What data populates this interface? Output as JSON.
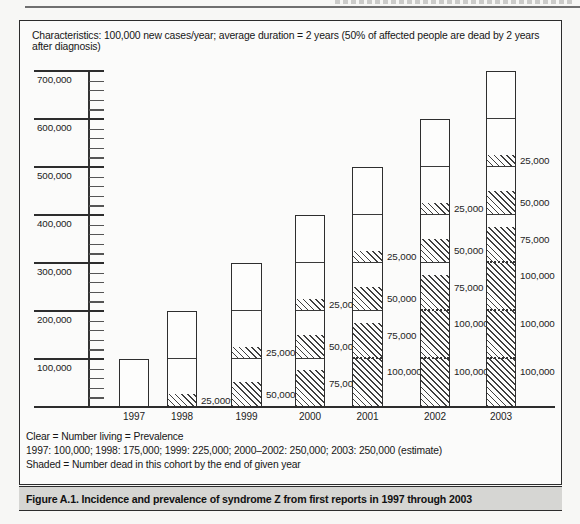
{
  "figure": {
    "characteristics": "Characteristics: 100,000 new cases/year; average duration = 2 years (50% of affected people are dead by 2 years after diagnosis)",
    "legend": {
      "line1": "Clear = Number living = Prevalence",
      "line2": "1997: 100,000; 1998: 175,000; 1999: 225,000; 2000–2002: 250,000; 2003: 250,000 (estimate)",
      "line3": "Shaded = Number dead in this cohort by the end of given year"
    },
    "caption": "Figure A.1. Incidence and prevalence of syndrome Z from first reports in 1997 through 2003"
  },
  "chart_data": {
    "type": "bar",
    "stacked": true,
    "title": "Figure A.1. Incidence and prevalence of syndrome Z from first reports in 1997 through 2003",
    "xlabel": "",
    "ylabel": "",
    "categories": [
      "1997",
      "1998",
      "1999",
      "2000",
      "2001",
      "2002",
      "2003"
    ],
    "y_axis": {
      "min": 0,
      "max": 700000,
      "major_tick_interval": 100000,
      "minor_tick_interval": 20000,
      "major_tick_labels": [
        "100,000",
        "200,000",
        "300,000",
        "400,000",
        "500,000",
        "600,000",
        "700,000"
      ]
    },
    "totals": [
      100000,
      200000,
      300000,
      400000,
      500000,
      600000,
      700000
    ],
    "prevalence_living": [
      100000,
      175000,
      225000,
      250000,
      250000,
      250000,
      250000
    ],
    "fill_legend": {
      "clear": "number living (prevalence)",
      "shaded": "number dead in cohort by end of given year"
    },
    "bars": [
      {
        "year": "1997",
        "segments": [
          {
            "v": 100,
            "fill": "clear"
          }
        ],
        "dividers": []
      },
      {
        "year": "1998",
        "segments": [
          {
            "v": 25,
            "fill": "shaded",
            "label": "25,000*"
          },
          {
            "v": 75,
            "fill": "clear"
          },
          {
            "v": 100,
            "fill": "clear"
          }
        ],
        "dividers": [
          {
            "at": 100,
            "style": "solid"
          }
        ]
      },
      {
        "year": "1999",
        "segments": [
          {
            "v": 50,
            "fill": "shaded",
            "label": "50,000"
          },
          {
            "v": 50,
            "fill": "clear"
          },
          {
            "v": 25,
            "fill": "shaded",
            "label": "25,000"
          },
          {
            "v": 75,
            "fill": "clear"
          },
          {
            "v": 100,
            "fill": "clear"
          }
        ],
        "dividers": [
          {
            "at": 100,
            "style": "solid"
          },
          {
            "at": 200,
            "style": "solid"
          }
        ]
      },
      {
        "year": "2000",
        "segments": [
          {
            "v": 75,
            "fill": "shaded",
            "label": "75,000"
          },
          {
            "v": 25,
            "fill": "clear"
          },
          {
            "v": 50,
            "fill": "shaded",
            "label": "50,000"
          },
          {
            "v": 50,
            "fill": "clear"
          },
          {
            "v": 25,
            "fill": "shaded",
            "label": "25,000"
          },
          {
            "v": 75,
            "fill": "clear"
          },
          {
            "v": 100,
            "fill": "clear"
          }
        ],
        "dividers": [
          {
            "at": 100,
            "style": "solid"
          },
          {
            "at": 200,
            "style": "solid"
          },
          {
            "at": 300,
            "style": "solid"
          }
        ]
      },
      {
        "year": "2001",
        "segments": [
          {
            "v": 100,
            "fill": "shaded",
            "label": "100,000"
          },
          {
            "v": 75,
            "fill": "shaded",
            "label": "75,000"
          },
          {
            "v": 25,
            "fill": "clear"
          },
          {
            "v": 50,
            "fill": "shaded",
            "label": "50,000"
          },
          {
            "v": 50,
            "fill": "clear"
          },
          {
            "v": 25,
            "fill": "shaded",
            "label": "25,000"
          },
          {
            "v": 75,
            "fill": "clear"
          },
          {
            "v": 100,
            "fill": "clear"
          }
        ],
        "dividers": [
          {
            "at": 100,
            "style": "dotted"
          },
          {
            "at": 200,
            "style": "solid"
          },
          {
            "at": 300,
            "style": "solid"
          },
          {
            "at": 400,
            "style": "solid"
          }
        ]
      },
      {
        "year": "2002",
        "segments": [
          {
            "v": 100,
            "fill": "shaded",
            "label": "100,000"
          },
          {
            "v": 100,
            "fill": "shaded",
            "label": "100,000"
          },
          {
            "v": 75,
            "fill": "shaded",
            "label": "75,000"
          },
          {
            "v": 25,
            "fill": "clear"
          },
          {
            "v": 50,
            "fill": "shaded",
            "label": "50,000"
          },
          {
            "v": 50,
            "fill": "clear"
          },
          {
            "v": 25,
            "fill": "shaded",
            "label": "25,000"
          },
          {
            "v": 75,
            "fill": "clear"
          },
          {
            "v": 100,
            "fill": "clear"
          }
        ],
        "dividers": [
          {
            "at": 100,
            "style": "dotted"
          },
          {
            "at": 200,
            "style": "dotted"
          },
          {
            "at": 300,
            "style": "solid"
          },
          {
            "at": 400,
            "style": "solid"
          },
          {
            "at": 500,
            "style": "solid"
          }
        ]
      },
      {
        "year": "2003",
        "segments": [
          {
            "v": 100,
            "fill": "shaded",
            "label": "100,000"
          },
          {
            "v": 100,
            "fill": "shaded",
            "label": "100,000"
          },
          {
            "v": 100,
            "fill": "shaded",
            "label": "100,000"
          },
          {
            "v": 75,
            "fill": "shaded",
            "label": "75,000"
          },
          {
            "v": 25,
            "fill": "clear"
          },
          {
            "v": 50,
            "fill": "shaded",
            "label": "50,000"
          },
          {
            "v": 50,
            "fill": "clear"
          },
          {
            "v": 25,
            "fill": "shaded",
            "label": "25,000"
          },
          {
            "v": 75,
            "fill": "clear"
          },
          {
            "v": 100,
            "fill": "clear"
          }
        ],
        "dividers": [
          {
            "at": 100,
            "style": "dotted"
          },
          {
            "at": 200,
            "style": "dotted"
          },
          {
            "at": 300,
            "style": "dotted"
          },
          {
            "at": 400,
            "style": "solid"
          },
          {
            "at": 500,
            "style": "solid"
          },
          {
            "at": 600,
            "style": "solid"
          }
        ]
      }
    ],
    "colors": {
      "ink": "#2d2d2d",
      "clear_fill": "#fdfdfc",
      "shaded_hatch": "#3f3f3f",
      "caption_band": "#d6d6d3"
    },
    "layout_hints": {
      "grid": "left tick stubs only",
      "legend_position": "below chart",
      "hatch_direction": "\\\\ diagonal"
    }
  }
}
